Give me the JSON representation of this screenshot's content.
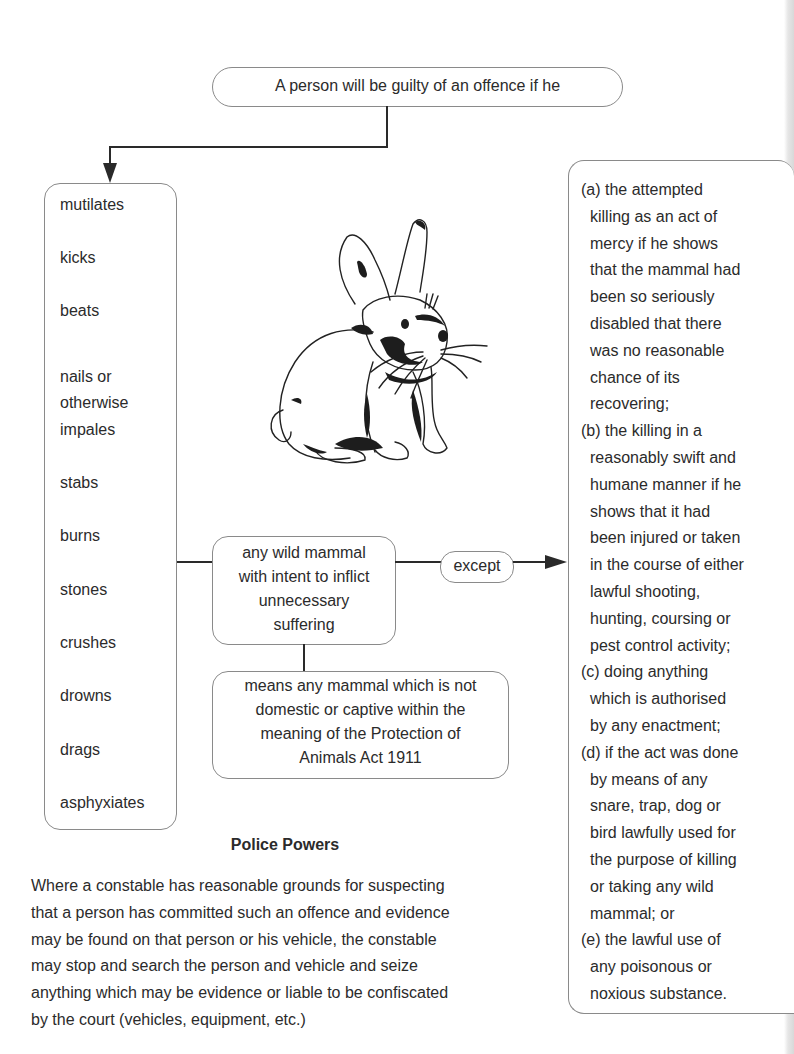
{
  "diagram": {
    "top_statement": "A person will be guilty of an offence if he",
    "verbs": [
      "mutilates",
      "kicks",
      "beats",
      "nails or",
      "otherwise",
      "impales",
      "stabs",
      "burns",
      "stones",
      "crushes",
      "drowns",
      "drags",
      "asphyxiates"
    ],
    "object_box": {
      "lines": [
        "any wild mammal",
        "with intent to inflict",
        "unnecessary",
        "suffering"
      ]
    },
    "except_label": "except",
    "definition_box": {
      "lines": [
        "means any mammal which is not",
        "domestic or captive within the",
        "meaning of the Protection of",
        "Animals Act 1911"
      ]
    },
    "exceptions": [
      {
        "label": "(a)",
        "lines": [
          "(a) the attempted",
          "killing as an act of",
          "mercy if he shows",
          "that the mammal had",
          "been so seriously",
          "disabled that there",
          "was no reasonable",
          "chance of its",
          "recovering;"
        ]
      },
      {
        "label": "(b)",
        "lines": [
          "(b) the killing in a",
          "reasonably swift and",
          "humane manner if he",
          "shows that it had",
          "been injured or taken",
          "in the course of either",
          "lawful shooting,",
          "hunting, coursing or",
          "pest control activity;"
        ]
      },
      {
        "label": "(c)",
        "lines": [
          "(c) doing anything",
          "which is authorised",
          "by any enactment;"
        ]
      },
      {
        "label": "(d)",
        "lines": [
          "(d) if the act was done",
          "by means of any",
          "snare, trap, dog or",
          "bird lawfully used for",
          "the purpose of killing",
          "or taking any wild",
          "mammal; or"
        ]
      },
      {
        "label": "(e)",
        "lines": [
          "(e) the lawful use of",
          "any poisonous or",
          "noxious substance."
        ]
      }
    ],
    "illustration": "rabbit-illustration"
  },
  "police_powers": {
    "title": "Police Powers",
    "lines": [
      "Where a constable has reasonable grounds for suspecting",
      "that a person has committed such an offence and evidence",
      "may be found on that person or his vehicle, the constable",
      "may stop and search the person and vehicle and seize",
      "anything which may be evidence or liable to be confiscated",
      "by the court (vehicles, equipment, etc.)"
    ]
  },
  "colors": {
    "text": "#2b2b2b",
    "lines": "#2a2a2a",
    "box_border": "#8a8a8a",
    "background": "#ffffff"
  }
}
